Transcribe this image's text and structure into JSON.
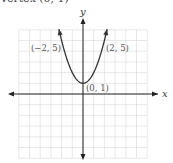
{
  "caption": {
    "text": "Vertex     (0, 1)"
  },
  "chart_data": {
    "type": "line",
    "title": "",
    "function": "y = x^2 + 1",
    "xlabel": "x",
    "ylabel": "y",
    "xlim": [
      -6,
      6
    ],
    "ylim": [
      -6,
      6
    ],
    "grid": true,
    "x": [
      -2,
      -1.5,
      -1,
      -0.5,
      0,
      0.5,
      1,
      1.5,
      2
    ],
    "y": [
      5,
      3.25,
      2,
      1.25,
      1,
      1.25,
      2,
      3.25,
      5
    ],
    "annotations": [
      {
        "label": "(−2, 5)",
        "x": -2,
        "y": 5
      },
      {
        "label": "(2, 5)",
        "x": 2,
        "y": 5
      },
      {
        "label": "(0, 1)",
        "x": 0,
        "y": 1
      }
    ],
    "legend": null
  },
  "labels": {
    "x_axis": "x",
    "y_axis": "y",
    "point_left": "(−2, 5)",
    "point_right": "(2, 5)",
    "vertex": "(0, 1)"
  },
  "colors": {
    "curve": "#333333",
    "grid": "#d9d9d9",
    "axis": "#222222"
  }
}
